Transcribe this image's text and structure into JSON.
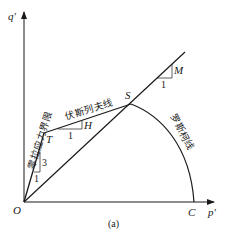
{
  "diagram": {
    "axes": {
      "y_label": "q'",
      "x_label": "p'",
      "origin_label": "O"
    },
    "points": {
      "T": "T",
      "S": "S",
      "C": "C"
    },
    "lines": {
      "zero_tension_cutoff": "零拉应力界限",
      "hvorslev_line": "伏斯列夫线",
      "roscoe_line": "罗斯柯线",
      "critical_state_line_slope": "M"
    },
    "slope_triangles": {
      "tension_cutoff": {
        "rise": "3",
        "run": "1"
      },
      "hvorslev": {
        "rise": "H",
        "run": "1"
      },
      "csl": {
        "rise": "M",
        "run": "1"
      }
    },
    "caption": "(a)",
    "colors": {
      "line": "#1a1a1a",
      "background": "#ffffff"
    }
  }
}
